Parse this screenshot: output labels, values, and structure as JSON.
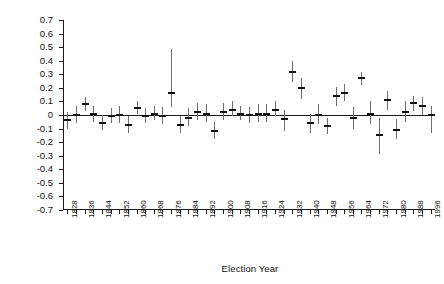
{
  "chart_data": {
    "type": "scatter",
    "title": "",
    "xlabel": "Election Year",
    "ylabel": "Deviation from the Normal Vote",
    "ylim": [
      -0.7,
      0.7
    ],
    "xlim": [
      1826,
      1998
    ],
    "grid": false,
    "legend": null,
    "ytick_labels": [
      "0.7",
      "0.6",
      "0.5",
      "0.4",
      "0.3",
      "0.2",
      "0.1",
      "0",
      "-0.1",
      "-0.2",
      "-0.3",
      "-0.4",
      "-0.5",
      "-0.6",
      "-0.7"
    ],
    "ytick_values": [
      0.7,
      0.6,
      0.5,
      0.4,
      0.3,
      0.2,
      0.1,
      0.0,
      -0.1,
      -0.2,
      -0.3,
      -0.4,
      -0.5,
      -0.6,
      -0.7
    ],
    "xtick_values": [
      1828,
      1832,
      1836,
      1840,
      1844,
      1848,
      1852,
      1856,
      1860,
      1864,
      1868,
      1872,
      1876,
      1880,
      1884,
      1888,
      1892,
      1896,
      1900,
      1904,
      1908,
      1912,
      1916,
      1920,
      1924,
      1928,
      1932,
      1936,
      1940,
      1944,
      1948,
      1952,
      1956,
      1960,
      1964,
      1968,
      1972,
      1976,
      1980,
      1984,
      1988,
      1992,
      1996
    ],
    "xtick_labels": [
      "1828",
      "",
      "1836",
      "",
      "1844",
      "",
      "1852",
      "",
      "1860",
      "",
      "1868",
      "",
      "1876",
      "",
      "1884",
      "",
      "1892",
      "",
      "1900",
      "",
      "1908",
      "",
      "1916",
      "",
      "1924",
      "",
      "1932",
      "",
      "1940",
      "",
      "1948",
      "",
      "1956",
      "",
      "1964",
      "",
      "1972",
      "",
      "1980",
      "",
      "1988",
      "",
      "1996"
    ],
    "zero_reference_line": 0,
    "point_color": "#111111",
    "errorbar_color": "#6e6e6e",
    "series": [
      {
        "name": "Deviation from the Normal Vote",
        "x": [
          1828,
          1832,
          1836,
          1840,
          1844,
          1848,
          1852,
          1856,
          1860,
          1864,
          1868,
          1872,
          1876,
          1880,
          1884,
          1888,
          1892,
          1896,
          1900,
          1904,
          1908,
          1912,
          1916,
          1920,
          1924,
          1928,
          1932,
          1936,
          1940,
          1944,
          1948,
          1952,
          1956,
          1960,
          1964,
          1968,
          1972,
          1976,
          1980,
          1984,
          1988,
          1992,
          1996
        ],
        "values": [
          -0.04,
          0.0,
          0.08,
          0.01,
          -0.06,
          -0.01,
          0.0,
          -0.07,
          0.05,
          -0.01,
          0.01,
          -0.01,
          0.16,
          -0.07,
          -0.02,
          0.02,
          0.01,
          -0.12,
          0.02,
          0.04,
          0.01,
          0.0,
          0.01,
          0.01,
          0.04,
          -0.03,
          0.32,
          0.2,
          -0.06,
          0.0,
          -0.08,
          0.14,
          0.16,
          -0.02,
          0.27,
          0.01,
          -0.15,
          0.11,
          -0.11,
          0.02,
          0.09,
          0.07,
          0.0
        ],
        "ci_lower": [
          -0.1,
          -0.06,
          0.03,
          -0.05,
          -0.11,
          -0.06,
          -0.06,
          -0.13,
          0.01,
          -0.06,
          -0.04,
          -0.07,
          0.06,
          -0.13,
          -0.08,
          -0.04,
          -0.05,
          -0.18,
          -0.04,
          -0.01,
          -0.04,
          -0.06,
          -0.05,
          -0.05,
          -0.01,
          -0.12,
          0.24,
          0.12,
          -0.13,
          -0.07,
          -0.14,
          0.07,
          0.1,
          -0.1,
          0.22,
          -0.07,
          -0.29,
          0.04,
          -0.18,
          -0.05,
          0.03,
          0.0,
          -0.13
        ],
        "ci_upper": [
          0.02,
          0.07,
          0.13,
          0.07,
          0.0,
          0.05,
          0.07,
          -0.01,
          0.1,
          0.05,
          0.07,
          0.06,
          0.49,
          -0.01,
          0.05,
          0.09,
          0.08,
          -0.05,
          0.09,
          0.1,
          0.07,
          0.06,
          0.08,
          0.08,
          0.1,
          0.04,
          0.4,
          0.27,
          0.01,
          0.08,
          -0.02,
          0.21,
          0.23,
          0.06,
          0.32,
          0.1,
          -0.02,
          0.18,
          -0.03,
          0.1,
          0.14,
          0.13,
          0.07
        ]
      }
    ]
  }
}
